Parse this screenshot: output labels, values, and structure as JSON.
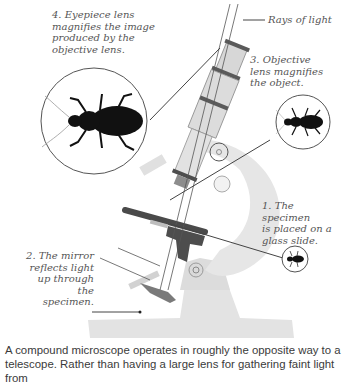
{
  "diagram": {
    "title": "Compound microscope",
    "labels": {
      "rays": "Rays of light",
      "step4": "4. Eyepiece lens\nmagnifies the image\nproduced by the\nobjective lens.",
      "step3": "3. Objective\nlens magnifies\nthe object.",
      "step1": "1. The specimen\nis placed on a\nglass slide.",
      "step2": "2. The mirror\nreflects light\nup through\nthe specimen."
    },
    "insets": [
      {
        "name": "large-beetle",
        "magnification": "eyepiece"
      },
      {
        "name": "medium-beetle",
        "magnification": "objective"
      },
      {
        "name": "small-beetle",
        "magnification": "specimen"
      }
    ],
    "colors": {
      "body_light": "#e4e4e4",
      "body_mid": "#c8c8c8",
      "dark": "#555555",
      "line": "#444444",
      "beetle": "#111111"
    }
  },
  "caption": "A compound microscope operates in roughly the opposite way to a\ntelescope. Rather than having a large lens for gathering faint light from"
}
